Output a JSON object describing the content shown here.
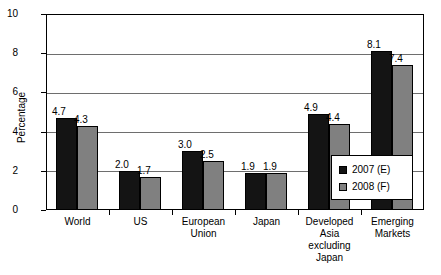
{
  "chart_data": {
    "type": "bar",
    "title": "",
    "xlabel": "",
    "ylabel": "Percentage",
    "ylim": [
      0,
      10
    ],
    "yticks": [
      0,
      2,
      4,
      6,
      8,
      10
    ],
    "ytick_labels": [
      "0",
      "2",
      "4",
      "6",
      "8",
      "10"
    ],
    "grid": true,
    "legend_position": "inside lower-right",
    "categories": [
      "World",
      "US",
      "European\nUnion",
      "Japan",
      "Developed\nAsia excluding\nJapan",
      "Emerging\nMarkets"
    ],
    "series": [
      {
        "name": "2007 (E)",
        "color": "#141414",
        "values": [
          4.7,
          2.0,
          3.0,
          1.9,
          4.9,
          8.1
        ],
        "labels": [
          "4.7",
          "2.0",
          "3.0",
          "1.9",
          "4.9",
          "8.1"
        ]
      },
      {
        "name": "2008 (F)",
        "color": "#808080",
        "values": [
          4.3,
          1.7,
          2.5,
          1.9,
          4.4,
          7.4
        ],
        "labels": [
          "4.3",
          "1.7",
          "2.5",
          "1.9",
          "4.4",
          "7.4"
        ]
      }
    ]
  }
}
